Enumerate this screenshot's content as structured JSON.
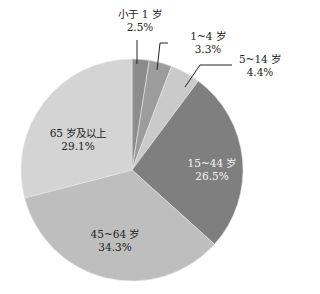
{
  "chart_data": {
    "type": "pie",
    "title": "",
    "start_angle": "12 o'clock",
    "direction": "clockwise",
    "categories": [
      "小于 1 岁",
      "1~4 岁",
      "5~14 岁",
      "15~44 岁",
      "45~64 岁",
      "65 岁及以上"
    ],
    "values": [
      2.5,
      3.3,
      4.4,
      26.5,
      34.3,
      29.1
    ],
    "value_labels": [
      "2.5%",
      "3.3%",
      "4.4%",
      "26.5%",
      "34.3%",
      "29.1%"
    ],
    "colors": [
      "#8c8c8c",
      "#9c9c9c",
      "#cacaca",
      "#7f7f7f",
      "#bebebe",
      "#d4d4d4"
    ],
    "legend": "none (labels on/beside slices)"
  },
  "labels": {
    "s0": {
      "name": "小于 1 岁",
      "pct": "2.5%"
    },
    "s1": {
      "name": "1~4 岁",
      "pct": "3.3%"
    },
    "s2": {
      "name": "5~14 岁",
      "pct": "4.4%"
    },
    "s3": {
      "name": "15~44 岁",
      "pct": "26.5%"
    },
    "s4": {
      "name": "45~64 岁",
      "pct": "34.3%"
    },
    "s5": {
      "name": "65 岁及以上",
      "pct": "29.1%"
    }
  }
}
